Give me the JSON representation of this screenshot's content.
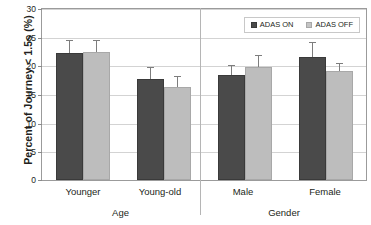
{
  "chart_data": {
    "type": "bar",
    "title": "",
    "xlabel": "",
    "ylabel": "Percent of Journey < 1.5s (%)",
    "ylim": [
      0,
      30
    ],
    "yticks": [
      0,
      5,
      10,
      15,
      20,
      25,
      30
    ],
    "ytick_labels": [
      "0",
      "5",
      "10",
      "15",
      "20",
      "25",
      "30"
    ],
    "grid": true,
    "legend_position": "top-right",
    "categories": [
      "Younger",
      "Young-old",
      "Male",
      "Female"
    ],
    "groups": [
      {
        "name": "Age",
        "categories": [
          "Younger",
          "Young-old"
        ]
      },
      {
        "name": "Gender",
        "categories": [
          "Male",
          "Female"
        ]
      }
    ],
    "series": [
      {
        "name": "ADAS ON",
        "color": "#4a4a4a",
        "values": [
          22.3,
          17.8,
          18.5,
          21.6
        ],
        "errors": [
          2.2,
          2.0,
          1.6,
          2.6
        ]
      },
      {
        "name": "ADAS OFF",
        "color": "#bdbdbd",
        "values": [
          22.4,
          16.3,
          19.8,
          19.1
        ],
        "errors": [
          2.2,
          1.9,
          2.2,
          1.4
        ]
      }
    ]
  },
  "axis": {
    "y_title": "Percent of Journey < 1.5s (%)",
    "tick_0": "0",
    "tick_5": "5",
    "tick_10": "10",
    "tick_15": "15",
    "tick_20": "20",
    "tick_25": "25",
    "tick_30": "30"
  },
  "legend": {
    "series_on": "ADAS ON",
    "series_off": "ADAS OFF"
  },
  "categories": {
    "cat_0": "Younger",
    "cat_1": "Young-old",
    "cat_2": "Male",
    "cat_3": "Female"
  },
  "groups": {
    "group_0": "Age",
    "group_1": "Gender"
  }
}
